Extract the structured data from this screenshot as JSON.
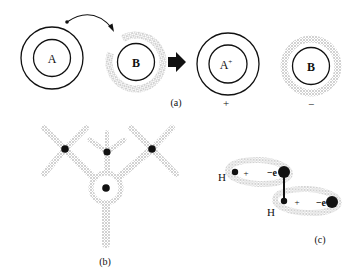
{
  "panel_a": {
    "caption": "(a)",
    "atom_a_label": "A",
    "atom_b_label": "B",
    "ion_a_label": "A",
    "ion_a_sup": "+",
    "ion_b_label": "B",
    "charge_plus": "+",
    "charge_minus": "−"
  },
  "panel_b": {
    "caption": "(b)"
  },
  "panel_c": {
    "caption": "(c)",
    "h_label_1": "H",
    "h_label_2": "H",
    "plus_1": "+",
    "plus_2": "+",
    "electron_1": "−e",
    "electron_2": "−e"
  },
  "colors": {
    "ink": "#111111",
    "halo": "#b8b8b8",
    "background": "#ffffff"
  }
}
